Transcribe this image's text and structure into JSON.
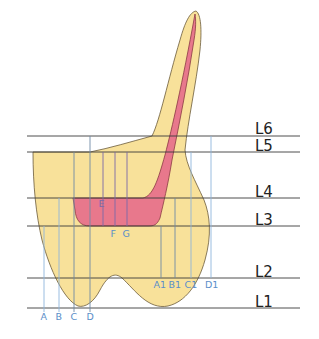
{
  "diagram": {
    "colors": {
      "tooth_fill": "#f8e19a",
      "tooth_outline": "#6b5a3a",
      "pulp_fill": "#e8788c",
      "pulp_outline": "#8a3a44",
      "level_line": "#3a3a3a",
      "point_line": "#8fb6dc",
      "point_label": "#5b8ec9"
    },
    "levels": [
      {
        "label": "L6",
        "y": 136
      },
      {
        "label": "L5",
        "y": 152
      },
      {
        "label": "L4",
        "y": 198
      },
      {
        "label": "L3",
        "y": 226
      },
      {
        "label": "L2",
        "y": 278
      },
      {
        "label": "L1",
        "y": 308
      }
    ],
    "points": [
      {
        "label": "A",
        "x": 44,
        "y_top": 226,
        "label_y": 319
      },
      {
        "label": "B",
        "x": 59,
        "y_top": 198,
        "label_y": 319
      },
      {
        "label": "C",
        "x": 74,
        "y_top": 152,
        "label_y": 319
      },
      {
        "label": "D",
        "x": 90,
        "y_top": 136,
        "label_y": 319
      },
      {
        "label": "E",
        "x": 103,
        "y_top": 152,
        "label_y": 206
      },
      {
        "label": "F",
        "x": 115,
        "y_top": 152,
        "label_y": 236
      },
      {
        "label": "G",
        "x": 127,
        "y_top": 152,
        "label_y": 236
      },
      {
        "label": "A1",
        "x": 161,
        "y_top": 226,
        "label_y": 287
      },
      {
        "label": "B1",
        "x": 175,
        "y_top": 198,
        "label_y": 287
      },
      {
        "label": "C1",
        "x": 191,
        "y_top": 152,
        "label_y": 287
      },
      {
        "label": "D1",
        "x": 211,
        "y_top": 136,
        "label_y": 287
      }
    ]
  }
}
